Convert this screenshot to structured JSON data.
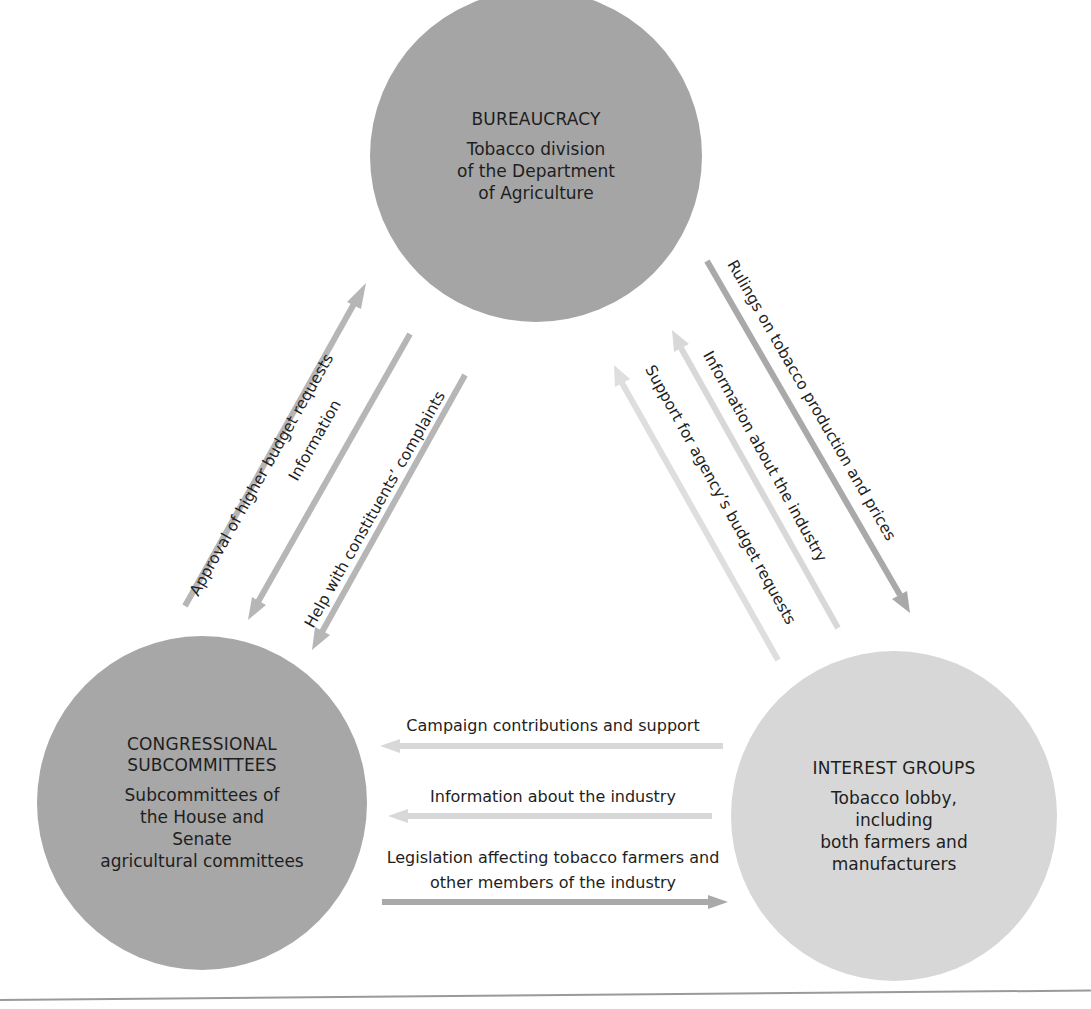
{
  "colors": {
    "bureaucracy": "#a5a5a5",
    "congress": "#a7a7a7",
    "interest": "#d7d7d7",
    "arrow_dark": "#a9a9a9",
    "arrow_mid": "#b6b6b6",
    "arrow_light": "#d8d8d8",
    "arrow_lighter": "#dedede"
  },
  "nodes": {
    "bureaucracy": {
      "title": "BUREAUCRACY",
      "desc": "Tobacco division\nof the Department\nof Agriculture"
    },
    "congress": {
      "title": "CONGRESSIONAL\nSUBCOMMITTEES",
      "desc": "Subcommittees of\nthe House and\nSenate\nagricultural committees"
    },
    "interest": {
      "title": "INTEREST GROUPS",
      "desc": "Tobacco lobby,\nincluding\nboth farmers and\nmanufacturers"
    }
  },
  "arrows": {
    "approval": {
      "label": "Approval of higher budget requests",
      "from": "congress",
      "to": "bureaucracy"
    },
    "information_left": {
      "label": "Information",
      "from": "bureaucracy",
      "to": "congress"
    },
    "help": {
      "label": "Help with constituents’ complaints",
      "from": "bureaucracy",
      "to": "congress"
    },
    "rulings": {
      "label": "Rulings on tobacco production and prices",
      "from": "bureaucracy",
      "to": "interest"
    },
    "information_right": {
      "label": "Information about the industry",
      "from": "interest",
      "to": "bureaucracy"
    },
    "support": {
      "label": "Support for agency’s budget requests",
      "from": "interest",
      "to": "bureaucracy"
    },
    "campaign": {
      "label": "Campaign contributions and support",
      "from": "interest",
      "to": "congress"
    },
    "information_bottom": {
      "label": "Information about the industry",
      "from": "interest",
      "to": "congress"
    },
    "legislation": {
      "label": "Legislation affecting tobacco farmers and\nother members of the industry",
      "from": "congress",
      "to": "interest"
    }
  }
}
